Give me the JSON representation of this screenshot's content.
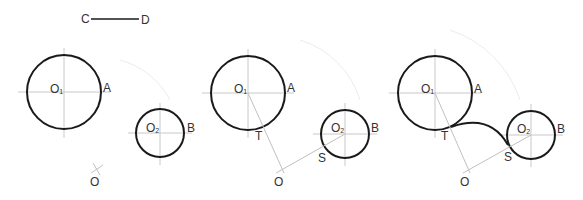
{
  "figure": {
    "segment": {
      "start_label": "C",
      "end_label": "D"
    },
    "panels": [
      {
        "step": 1,
        "circle1": {
          "center_label": "O",
          "center_sub": "1",
          "point_label": "A"
        },
        "circle2": {
          "center_label": "O",
          "center_sub": "2",
          "point_label": "B"
        },
        "arc_center_label": "O"
      },
      {
        "step": 2,
        "circle1": {
          "center_label": "O",
          "center_sub": "1",
          "point_label": "A"
        },
        "circle2": {
          "center_label": "O",
          "center_sub": "2",
          "point_label": "B"
        },
        "arc_center_label": "O",
        "tangent1_label": "T",
        "tangent2_label": "S"
      },
      {
        "step": 3,
        "circle1": {
          "center_label": "O",
          "center_sub": "1",
          "point_label": "A"
        },
        "circle2": {
          "center_label": "O",
          "center_sub": "2",
          "point_label": "B"
        },
        "arc_center_label": "O",
        "tangent1_label": "T",
        "tangent2_label": "S"
      }
    ]
  },
  "colors": {
    "outline": "#1a1a1a",
    "construction": "#c0c0c0",
    "text": "#333333"
  }
}
